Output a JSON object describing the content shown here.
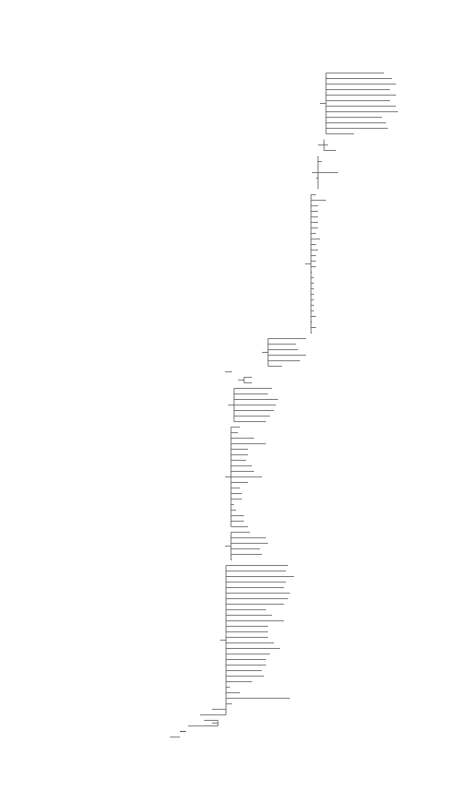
{
  "leaves": [
    {
      "name": "Anacamptis_pyramidalis",
      "x": 384,
      "y": 73
    },
    {
      "name": "Orchis_fragransP",
      "x": 392,
      "y": 79
    },
    {
      "name": "Orchis_coriophora",
      "x": 396,
      "y": 85
    },
    {
      "name": "Orchis_sancta",
      "x": 390,
      "y": 91
    },
    {
      "name": "Orchis_papilionacea_rubra",
      "x": 396,
      "y": 97
    },
    {
      "name": "Orchis_morio",
      "x": 390,
      "y": 103
    },
    {
      "name": "Orchis_champagneuxii",
      "x": 396,
      "y": 109
    },
    {
      "name": "Orchis_longicornuP",
      "x": 398,
      "y": 115
    },
    {
      "name": "Orchis_syriacaP",
      "x": 382,
      "y": 121
    },
    {
      "name": "Orchis_israeliticaP",
      "x": 386,
      "y": 127
    },
    {
      "name": "Orchis_boryi",
      "x": 388,
      "y": 133
    },
    {
      "name": "Orchis_collina",
      "x": 354,
      "y": 139
    },
    {
      "name": "Orchis_robustaP",
      "x": 324,
      "y": 145
    },
    {
      "name": "Orchis_palustrisP",
      "x": 328,
      "y": 151
    },
    {
      "name": "Orchis_laxiflora",
      "x": 336,
      "y": 157
    },
    {
      "name": "Serapias_lingua",
      "x": 318,
      "y": 163
    },
    {
      "name": "Serapias_cordigera",
      "x": 322,
      "y": 169
    },
    {
      "name": "Serapias_neglecta",
      "x": 318,
      "y": 175
    },
    {
      "name": "Serapias_parviflora",
      "x": 338,
      "y": 181
    },
    {
      "name": "Serapias_vomeracea",
      "x": 316,
      "y": 187
    },
    {
      "name": "Serapias_orientalis",
      "x": 318,
      "y": 193
    },
    {
      "name": "Serapias_bergonii",
      "x": 318,
      "y": 199
    },
    {
      "name": "Ophrys_aesculapii",
      "x": 316,
      "y": 205
    },
    {
      "name": "Ophrys_aleganisP",
      "x": 326,
      "y": 211
    },
    {
      "name": "Ophrys_bertoloniiformis",
      "x": 318,
      "y": 217
    },
    {
      "name": "Ophrys_cretica",
      "x": 318,
      "y": 223
    },
    {
      "name": "Ophrys_araneola",
      "x": 318,
      "y": 229
    },
    {
      "name": "Ophrys_sprunerP",
      "x": 318,
      "y": 235
    },
    {
      "name": "Ophrys_sphegodes",
      "x": 318,
      "y": 241
    },
    {
      "name": "Ophrys_levantinaP",
      "x": 316,
      "y": 247
    },
    {
      "name": "Ophrys_umbilicataP",
      "x": 320,
      "y": 253
    },
    {
      "name": "Ophrys_candicaP",
      "x": 316,
      "y": 259
    },
    {
      "name": "Ophrys_scolopax",
      "x": 318,
      "y": 265
    },
    {
      "name": "Ophrys_heldreichii",
      "x": 316,
      "y": 271
    },
    {
      "name": "Ophrys_sphegiferaP",
      "x": 316,
      "y": 277
    },
    {
      "name": "Ophrys_fuciflora",
      "x": 316,
      "y": 283
    },
    {
      "name": "Ophrys_episcopalis",
      "x": 312,
      "y": 289
    },
    {
      "name": "Ophrys_apifera",
      "x": 314,
      "y": 295
    },
    {
      "name": "Ophrys_bombyliflora",
      "x": 314,
      "y": 301
    },
    {
      "name": "Ophrys_speculum",
      "x": 314,
      "y": 307
    },
    {
      "name": "Ophrys_regis_ferdinandii",
      "x": 314,
      "y": 313
    },
    {
      "name": "Ophrys_insolioP",
      "x": 314,
      "y": 319
    },
    {
      "name": "Ophrys_atlanticaP",
      "x": 314,
      "y": 325
    },
    {
      "name": "Ophrys_dyrisP",
      "x": 314,
      "y": 331
    },
    {
      "name": "Ophrys_fusca",
      "x": 316,
      "y": 337
    },
    {
      "name": "Ophrys_lutea",
      "x": 312,
      "y": 343
    },
    {
      "name": "Ophrys_insectifera",
      "x": 316,
      "y": 349
    },
    {
      "name": "Ophrys_tenthredinifera",
      "x": 312,
      "y": 355
    },
    {
      "name": "Barlia_robertiana",
      "x": 306,
      "y": 361
    },
    {
      "name": "Himantoglossum_hircinum",
      "x": 296,
      "y": 367
    },
    {
      "name": "Himantoglossum_adriaticum",
      "x": 298,
      "y": 373
    },
    {
      "name": "Himantoglossum_calcaratumP",
      "x": 306,
      "y": 379
    },
    {
      "name": "Himantoglossum_caprinum",
      "x": 300,
      "y": 385
    },
    {
      "name": "Comperia_comperianaP",
      "x": 282,
      "y": 391
    },
    {
      "name": "Pseudorchis_albida",
      "x": 232,
      "y": 397
    },
    {
      "name": "Galearis_cyclochila",
      "x": 252,
      "y": 403
    },
    {
      "name": "Galearis_spectabilis",
      "x": 252,
      "y": 409
    },
    {
      "name": "Platanthera_chlorantha",
      "x": 272,
      "y": 415
    },
    {
      "name": "Platanthera_bifolia",
      "x": 268,
      "y": 421
    },
    {
      "name": "Platanthera_florentia",
      "x": 278,
      "y": 427
    },
    {
      "name": "Piperia_undascensisP",
      "x": 276,
      "y": 433
    },
    {
      "name": "Platanthera_grandiflora",
      "x": 274,
      "y": 439
    },
    {
      "name": "Platanthera_sonoharai",
      "x": 270,
      "y": 445
    },
    {
      "name": "Platanthera_hyperborea_virid",
      "x": 266,
      "y": 451
    },
    {
      "name": "Coeloglossum_viride",
      "x": 240,
      "y": 457
    },
    {
      "name": "Dactylorhiza_aristata",
      "x": 238,
      "y": 463
    },
    {
      "name": "Dactylorhiza_foliosa",
      "x": 254,
      "y": 469
    },
    {
      "name": "Dactylorhiza_iberica",
      "x": 266,
      "y": 475
    },
    {
      "name": "Dactylorhiza_maculata",
      "x": 248,
      "y": 481
    },
    {
      "name": "Dactylorhiza_fuchsii",
      "x": 248,
      "y": 487
    },
    {
      "name": "Dactylorhiza_elata",
      "x": 246,
      "y": 493
    },
    {
      "name": "Dactylorhiza_traunst_lapponica",
      "x": 252,
      "y": 499
    },
    {
      "name": "Dactylorhiza_traunsteineraSS",
      "x": 254,
      "y": 505
    },
    {
      "name": "Dactylorhiza_praetermissa",
      "x": 262,
      "y": 511
    },
    {
      "name": "Dactylorhiza_albestris",
      "x": 248,
      "y": 517
    },
    {
      "name": "Dactylorhiza_romana",
      "x": 240,
      "y": 523
    },
    {
      "name": "Dactylorhiza_incarnata_pulchell",
      "x": 242,
      "y": 529
    },
    {
      "name": "Dactylorhiza_incarnata-coccinea",
      "x": 242,
      "y": 535
    },
    {
      "name": "Gymnadenia_conopsea",
      "x": 234,
      "y": 541
    },
    {
      "name": "Gymnadenia_conopsea_borealis",
      "x": 236,
      "y": 547
    },
    {
      "name": "Nigritella_nigra",
      "x": 244,
      "y": 553
    },
    {
      "name": "Nigritella_rubraP",
      "x": 244,
      "y": 559
    },
    {
      "name": "Neotinea_maculata",
      "x": 248,
      "y": 565
    },
    {
      "name": "Orchis_cibensisP",
      "x": 250,
      "y": 571
    },
    {
      "name": "Orchis_lactea",
      "x": 266,
      "y": 577
    },
    {
      "name": "Orchis_conicaP",
      "x": 268,
      "y": 583
    },
    {
      "name": "Orchis_ustulata",
      "x": 260,
      "y": 589
    },
    {
      "name": "Orchis_tridentata",
      "x": 262,
      "y": 595
    },
    {
      "name": "Aceras_anthropophorum",
      "x": 232,
      "y": 601
    },
    {
      "name": "Orchis_troodiP",
      "x": 288,
      "y": 607
    },
    {
      "name": "Orchis_anatolica",
      "x": 286,
      "y": 613
    },
    {
      "name": "Orchis_branciforttiP",
      "x": 294,
      "y": 619
    },
    {
      "name": "Orchis_quadripunctata",
      "x": 286,
      "y": 625
    },
    {
      "name": "Orchis_sitiaca",
      "x": 284,
      "y": 631
    },
    {
      "name": "Orchis_spitzeliP",
      "x": 290,
      "y": 637
    },
    {
      "name": "Orchis_priscaP",
      "x": 288,
      "y": 643
    },
    {
      "name": "Orchis_tanarensisP",
      "x": 284,
      "y": 649
    },
    {
      "name": "Orchis_provincialisP",
      "x": 266,
      "y": 655
    },
    {
      "name": "Orchis_pallensP",
      "x": 272,
      "y": 661
    },
    {
      "name": "Orchis_mascula_signifera",
      "x": 284,
      "y": 667
    },
    {
      "name": "Orchis_mascula_ionnusaeP",
      "x": 268,
      "y": 673
    },
    {
      "name": "Orchis_mascula",
      "x": 268,
      "y": 679
    },
    {
      "name": "Orchis_mascula_hispanicaP",
      "x": 268,
      "y": 685
    },
    {
      "name": "Orchis_scopulorumP",
      "x": 274,
      "y": 691
    },
    {
      "name": "Orchis_pauciflora",
      "x": 280,
      "y": 697
    },
    {
      "name": "Orchis_militaris",
      "x": 270,
      "y": 703
    },
    {
      "name": "Orchis_purpurea",
      "x": 266,
      "y": 709
    },
    {
      "name": "Orchis_galilaeaP",
      "x": 266,
      "y": 715
    },
    {
      "name": "Orchis_simia",
      "x": 262,
      "y": 721
    },
    {
      "name": "Orchis_punctulataP",
      "x": 264,
      "y": 727
    },
    {
      "name": "Orchis_italica",
      "x": 252,
      "y": 733
    },
    {
      "name": "Traunsteinera-globosa",
      "x": 230,
      "y": 739
    },
    {
      "name": "Chamorchis_alpinaP",
      "x": 240,
      "y": 745
    },
    {
      "name": "Neottianthe_cucullataP",
      "x": 290,
      "y": 751
    },
    {
      "name": "Chusua_donjiP",
      "x": 232,
      "y": 757
    },
    {
      "name": "Habenaria_tridactylitesP",
      "x": 212,
      "y": 763
    },
    {
      "name": "Pecteilis_radiata",
      "x": 200,
      "y": 769
    },
    {
      "name": "Habenaria_sagittifera",
      "x": 204,
      "y": 775
    },
    {
      "name": "Habenaria_tibeticaP",
      "x": 188,
      "y": 781
    },
    {
      "name": "Herminium_monorchisP",
      "x": 180,
      "y": 787
    },
    {
      "name": "Herminium_alaschianumP",
      "x": 180,
      "y": 793
    }
  ],
  "leaves_bottom": [
    {
      "name": "Herminium_lanceum",
      "x": 166,
      "y": 739
    },
    {
      "name": "Habenaria_procera",
      "x": 194,
      "y": 745
    },
    {
      "name": "Habenaria_socotranaP",
      "x": 194,
      "y": 751
    },
    {
      "name": "Habenaria_quinquesela",
      "x": 282,
      "y": 757
    },
    {
      "name": "Habenaria_odontopetala",
      "x": 192,
      "y": 763
    },
    {
      "name": "Gennaria_diphylla",
      "x": 130,
      "y": 769
    },
    {
      "name": "Holothrix_scopularia",
      "x": 106,
      "y": 775
    },
    {
      "name": "Disa_uniflora",
      "x": 90,
      "y": 781
    }
  ]
}
